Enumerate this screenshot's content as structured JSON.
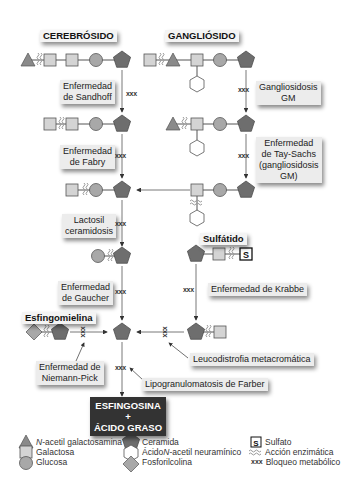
{
  "titles": {
    "cerebrosido": "CEREBRÓSIDO",
    "gangliosido": "GANGLIÓSIDO",
    "sulfatido": "Sulfátido",
    "esfingomielina": "Esfingomielina"
  },
  "diseases": {
    "sandhoff": [
      "Enfermedad",
      "de Sandhoff"
    ],
    "gangliosidosis_gm": [
      "Gangliosidosis",
      "GM"
    ],
    "fabry": [
      "Enfermedad",
      "de Fabry"
    ],
    "tay_sachs": [
      "Enfermedad",
      "de Tay-Sachs",
      "(gangliosidosis",
      "GM)"
    ],
    "lactosil": [
      "Lactosil",
      "ceramidosis"
    ],
    "gaucher": [
      "Enfermedad",
      "de Gaucher"
    ],
    "krabbe": "Enfermedad de Krabbe",
    "niemann_pick": [
      "Enfermedad de",
      "Niemann-Pick"
    ],
    "leucodistrofia": "Leucodistrofia metacromática",
    "farber": "Lipogranulomatosis de Farber"
  },
  "block_marker": "xxx",
  "sulfate_symbol": "S",
  "final_product": [
    "ESFINGOSINA",
    "+",
    "ÁCIDO GRASO"
  ],
  "legend": {
    "col1": [
      {
        "icon": "triangle-icon",
        "prefix_italic": "N",
        "label": "-acetil galactosamina"
      },
      {
        "icon": "square-icon",
        "label": "Galactosa"
      },
      {
        "icon": "circle-icon",
        "label": "Glucosa"
      }
    ],
    "col2": [
      {
        "icon": "pentagon-icon",
        "label": "Ceramida"
      },
      {
        "icon": "hexagon-icon",
        "label_pre": "Ácido ",
        "label_italic": "N",
        "label_post": "-acetil neuramínico"
      },
      {
        "icon": "diamond-icon",
        "label": "Fosforilcolina"
      }
    ],
    "col3": [
      {
        "icon": "sulfate-icon",
        "label": "Sulfato"
      },
      {
        "icon": "enzyme-action-icon",
        "label": "Acción enzimática"
      },
      {
        "icon": "block-marker",
        "marker": "xxx",
        "label": "Bloqueo metabólico"
      }
    ]
  },
  "colors": {
    "triangle": "#8a8a8a",
    "square": "#d4d4d4",
    "circle": "#a8a8a8",
    "pentagon": "#6e6e6e",
    "final_bg": "#333333",
    "label_bg": "#ececec"
  }
}
